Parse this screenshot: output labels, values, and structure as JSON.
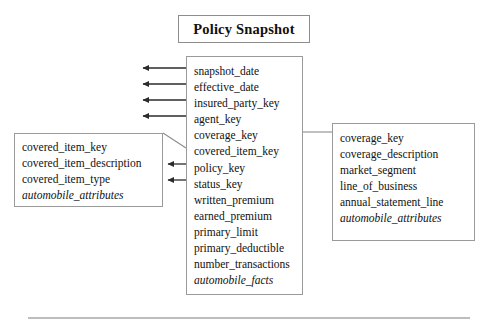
{
  "diagram": {
    "title": "Policy Snapshot",
    "entities": [
      {
        "id": "policy_snapshot_fact",
        "name": "Policy Snapshot fact table",
        "attributes": [
          {
            "label": "snapshot_date",
            "italic": false
          },
          {
            "label": "effective_date",
            "italic": false
          },
          {
            "label": "insured_party_key",
            "italic": false
          },
          {
            "label": "agent_key",
            "italic": false
          },
          {
            "label": "coverage_key",
            "italic": false
          },
          {
            "label": "covered_item_key",
            "italic": false
          },
          {
            "label": "policy_key",
            "italic": false
          },
          {
            "label": "status_key",
            "italic": false
          },
          {
            "label": "written_premium",
            "italic": false
          },
          {
            "label": "earned_premium",
            "italic": false
          },
          {
            "label": "primary_limit",
            "italic": false
          },
          {
            "label": "primary_deductible",
            "italic": false
          },
          {
            "label": "number_transactions",
            "italic": false
          },
          {
            "label": "automobile_facts",
            "italic": true
          }
        ]
      },
      {
        "id": "covered_item_dimension",
        "name": "Covered Item dimension",
        "attributes": [
          {
            "label": "covered_item_key",
            "italic": false
          },
          {
            "label": "covered_item_description",
            "italic": false
          },
          {
            "label": "covered_item_type",
            "italic": false
          },
          {
            "label": "automobile_attributes",
            "italic": true
          }
        ]
      },
      {
        "id": "coverage_dimension",
        "name": "Coverage dimension",
        "attributes": [
          {
            "label": "coverage_key",
            "italic": false
          },
          {
            "label": "coverage_description",
            "italic": false
          },
          {
            "label": "market_segment",
            "italic": false
          },
          {
            "label": "line_of_business",
            "italic": false
          },
          {
            "label": "annual_statement_line",
            "italic": false
          },
          {
            "label": "automobile_attributes",
            "italic": true
          }
        ]
      }
    ],
    "colors": {
      "box_border": "#9a9a9a",
      "title_border": "#8d8d8d",
      "connector": "#2b2b2b",
      "rule": "#bdbdbd",
      "background": "#ffffff",
      "text": "#111111"
    }
  }
}
